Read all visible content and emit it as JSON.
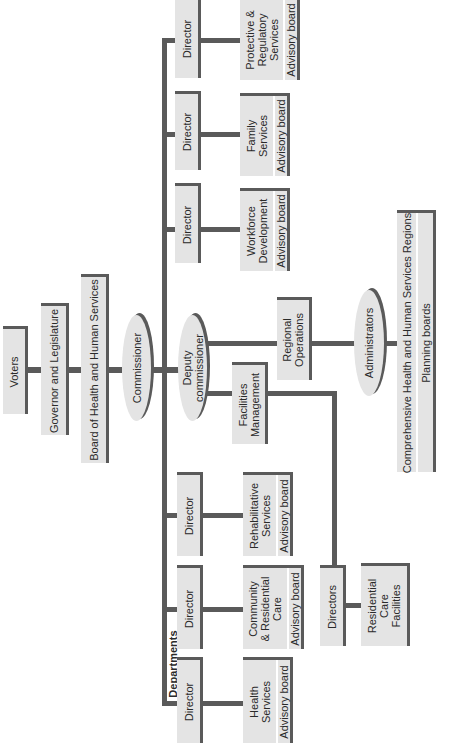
{
  "chart": {
    "top_chain": {
      "voters": "Voters",
      "governor": "Governor and Legislature",
      "board": "Board of Health and Human Services",
      "commissioner": "Commissioner",
      "deputy": "Deputy commissioner"
    },
    "departments_label": "Departments",
    "departments": [
      {
        "director": "Director",
        "name": "Protective & Regulatory Services",
        "name_lines": [
          "Protective &",
          "Regulatory",
          "Services"
        ],
        "board": "Advisory board"
      },
      {
        "director": "Director",
        "name": "Family Services",
        "name_lines": [
          "Family",
          "Services"
        ],
        "board": "Advisory board"
      },
      {
        "director": "Director",
        "name": "Workforce Development",
        "name_lines": [
          "Workforce",
          "Development"
        ],
        "board": "Advisory board"
      },
      {
        "director": "Director",
        "name": "Rehabilitative Services",
        "name_lines": [
          "Rehabilitative",
          "Services"
        ],
        "board": "Advisory board"
      },
      {
        "director": "Director",
        "name": "Community & Residential Care",
        "name_lines": [
          "Community",
          "& Residential",
          "Care"
        ],
        "board": "Advisory board"
      },
      {
        "director": "Director",
        "name": "Health Services",
        "name_lines": [
          "Health",
          "Services"
        ],
        "board": "Advisory board"
      }
    ],
    "regional": {
      "operations": "Regional Operations",
      "operations_lines": [
        "Regional",
        "Operations"
      ],
      "administrators": "Administrators",
      "regions": "Comprehensive Health and Human Services Regions",
      "planning": "Planning boards"
    },
    "facilities": {
      "management": "Facilities Management",
      "management_lines": [
        "Facilities",
        "Management"
      ],
      "directors": "Directors",
      "residential": "Residential Care Facilities",
      "residential_lines": [
        "Residential",
        "Care",
        "Facilities"
      ]
    }
  }
}
